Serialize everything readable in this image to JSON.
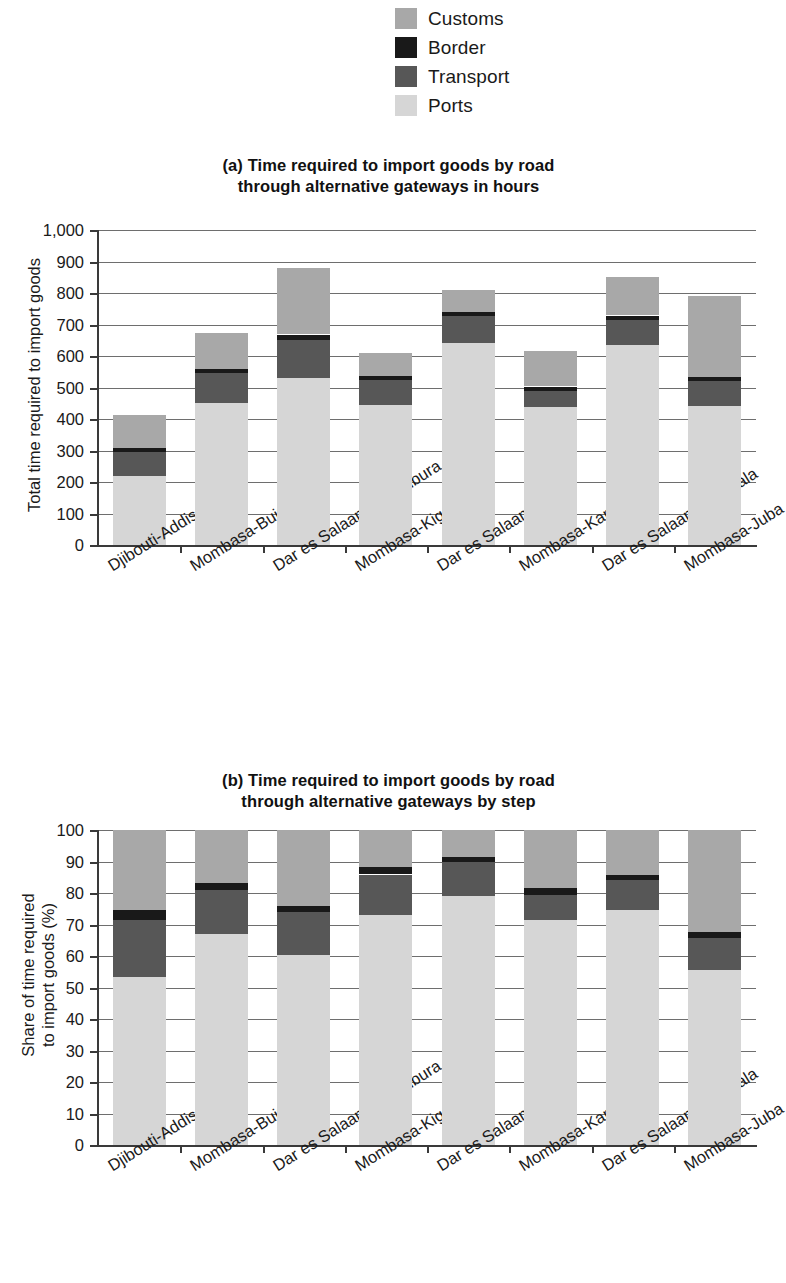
{
  "legend": {
    "items": [
      {
        "label": "Customs",
        "color": "#a8a8a8"
      },
      {
        "label": "Border",
        "color": "#191919"
      },
      {
        "label": "Transport",
        "color": "#575757"
      },
      {
        "label": "Ports",
        "color": "#d6d6d6"
      }
    ]
  },
  "panel_a": {
    "title_line1": "(a) Time required to import goods by road",
    "title_line2": "through alternative gateways in hours",
    "ylabel_line1": "Total time required to import goods"
  },
  "panel_b": {
    "title_line1": "(b) Time required to import goods by road",
    "title_line2": "through alternative gateways by step",
    "ylabel_line1": "Share of time required",
    "ylabel_line2": "to import goods  (%)"
  },
  "categories": [
    "Djibouti-Addis",
    "Mombasa-Bujumbura",
    "Dar es Salaam-Bujumbura",
    "Mombasa-Kigali",
    "Dar es Salaam-Kigali",
    "Mombasa-Kampala",
    "Dar es Salaam-Kampala",
    "Mombasa-Juba"
  ],
  "chart_data": [
    {
      "type": "bar",
      "id": "panel-a",
      "stacked": true,
      "title": "(a) Time required to import goods by road through alternative gateways in hours",
      "xlabel": "",
      "ylabel": "Total time required to import goods",
      "ylim": [
        0,
        1000
      ],
      "yticks": [
        "0",
        "100",
        "200",
        "300",
        "400",
        "500",
        "600",
        "700",
        "800",
        "900",
        "1,000"
      ],
      "ytick_values": [
        0,
        100,
        200,
        300,
        400,
        500,
        600,
        700,
        800,
        900,
        1000
      ],
      "grid": true,
      "legend_position": "above-figure",
      "categories": [
        "Djibouti-Addis",
        "Mombasa-Bujumbura",
        "Dar es Salaam-Bujumbura",
        "Mombasa-Kigali",
        "Dar es Salaam-Kigali",
        "Mombasa-Kampala",
        "Dar es Salaam-Kampala",
        "Mombasa-Juba"
      ],
      "series": [
        {
          "name": "Ports",
          "color": "#d6d6d6",
          "values": [
            220,
            450,
            530,
            445,
            640,
            440,
            635,
            440
          ]
        },
        {
          "name": "Transport",
          "color": "#575757",
          "values": [
            75,
            95,
            120,
            78,
            87,
            50,
            80,
            80
          ]
        },
        {
          "name": "Border",
          "color": "#191919",
          "values": [
            13,
            14,
            17,
            14,
            12,
            13,
            13,
            14
          ]
        },
        {
          "name": "Customs",
          "color": "#a8a8a8",
          "values": [
            105,
            114,
            211,
            73,
            69,
            112,
            122,
            256
          ]
        }
      ],
      "totals": [
        413,
        673,
        878,
        610,
        808,
        615,
        850,
        790
      ]
    },
    {
      "type": "bar",
      "id": "panel-b",
      "stacked": true,
      "title": "(b) Time required to import goods by road through alternative gateways by step",
      "xlabel": "",
      "ylabel": "Share of time required to import goods (%)",
      "ylim": [
        0,
        100
      ],
      "yticks": [
        "0",
        "10",
        "20",
        "30",
        "40",
        "50",
        "60",
        "70",
        "80",
        "90",
        "100"
      ],
      "ytick_values": [
        0,
        10,
        20,
        30,
        40,
        50,
        60,
        70,
        80,
        90,
        100
      ],
      "grid": true,
      "legend_position": "above-figure",
      "categories": [
        "Djibouti-Addis",
        "Mombasa-Bujumbura",
        "Dar es Salaam-Bujumbura",
        "Mombasa-Kigali",
        "Dar es Salaam-Kigali",
        "Mombasa-Kampala",
        "Dar es Salaam-Kampala",
        "Mombasa-Juba"
      ],
      "series": [
        {
          "name": "Ports",
          "color": "#d6d6d6",
          "values": [
            53.3,
            66.9,
            60.4,
            73.0,
            79.2,
            71.5,
            74.7,
            55.7
          ]
        },
        {
          "name": "Transport",
          "color": "#575757",
          "values": [
            18.2,
            14.1,
            13.7,
            12.8,
            10.8,
            8.1,
            9.4,
            10.1
          ]
        },
        {
          "name": "Border",
          "color": "#191919",
          "values": [
            3.1,
            2.1,
            1.9,
            2.3,
            1.5,
            2.1,
            1.5,
            1.8
          ]
        },
        {
          "name": "Customs",
          "color": "#a8a8a8",
          "values": [
            25.4,
            16.9,
            24.0,
            11.9,
            8.5,
            18.3,
            14.4,
            32.4
          ]
        }
      ],
      "totals": [
        100,
        100,
        100,
        100,
        100,
        100,
        100,
        100
      ]
    }
  ]
}
